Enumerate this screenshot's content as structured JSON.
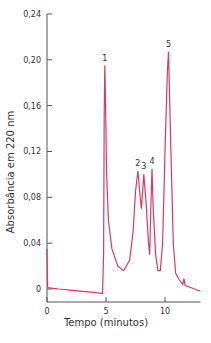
{
  "chart_data": {
    "type": "line",
    "title": "",
    "xlabel": "Tempo (minutos)",
    "ylabel": "Absorbância em 220 nm",
    "xlim": [
      0,
      13
    ],
    "ylim": [
      0,
      0.24
    ],
    "x_ticks": [
      "0",
      "5",
      "10"
    ],
    "y_ticks": [
      "0",
      "0,04",
      "0,08",
      "0,12",
      "0,16",
      "0,20",
      "0,24"
    ],
    "grid": false,
    "line_color": "#d83a64",
    "peaks": [
      {
        "label": "1",
        "x": 4.9,
        "y": 0.195
      },
      {
        "label": "2",
        "x": 7.7,
        "y": 0.103
      },
      {
        "label": "3",
        "x": 8.2,
        "y": 0.1
      },
      {
        "label": "4",
        "x": 8.9,
        "y": 0.105
      },
      {
        "label": "5",
        "x": 10.3,
        "y": 0.207
      }
    ],
    "series": [
      {
        "name": "absorbance",
        "x": [
          0,
          0.05,
          0.1,
          0.2,
          1,
          2,
          3,
          4,
          4.7,
          4.8,
          4.85,
          4.9,
          4.95,
          5.05,
          5.2,
          5.5,
          6,
          6.5,
          7,
          7.3,
          7.5,
          7.7,
          7.9,
          8.0,
          8.2,
          8.4,
          8.6,
          8.7,
          8.8,
          8.9,
          9.0,
          9.2,
          9.4,
          9.6,
          9.8,
          10.0,
          10.2,
          10.3,
          10.5,
          10.7,
          10.9,
          11.2,
          11.5,
          11.6,
          11.7,
          12,
          12.5,
          13
        ],
        "y": [
          0.035,
          0.002,
          0.001,
          0.001,
          0.0,
          -0.001,
          -0.002,
          -0.003,
          -0.004,
          0.03,
          0.15,
          0.195,
          0.17,
          0.1,
          0.06,
          0.035,
          0.02,
          0.016,
          0.025,
          0.05,
          0.085,
          0.103,
          0.08,
          0.07,
          0.1,
          0.075,
          0.04,
          0.03,
          0.07,
          0.105,
          0.07,
          0.03,
          0.016,
          0.016,
          0.04,
          0.12,
          0.19,
          0.207,
          0.12,
          0.04,
          0.014,
          0.008,
          0.004,
          0.009,
          0.003,
          0.002,
          0.0,
          -0.002
        ]
      }
    ]
  }
}
